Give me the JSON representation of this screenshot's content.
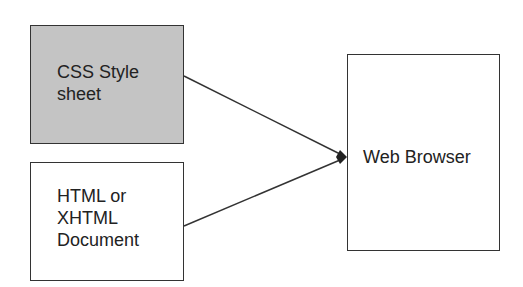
{
  "diagram": {
    "nodes": [
      {
        "id": "css",
        "label_lines": [
          "CSS Style",
          "sheet"
        ],
        "fill": "#c4c4c4"
      },
      {
        "id": "html",
        "label_lines": [
          "HTML or",
          "XHTML",
          "Document"
        ],
        "fill": "#ffffff"
      },
      {
        "id": "browser",
        "label": "Web Browser",
        "fill": "#ffffff"
      }
    ],
    "edges": [
      {
        "from": "css",
        "to": "browser"
      },
      {
        "from": "html",
        "to": "browser"
      }
    ],
    "stroke_color": "#333333"
  }
}
